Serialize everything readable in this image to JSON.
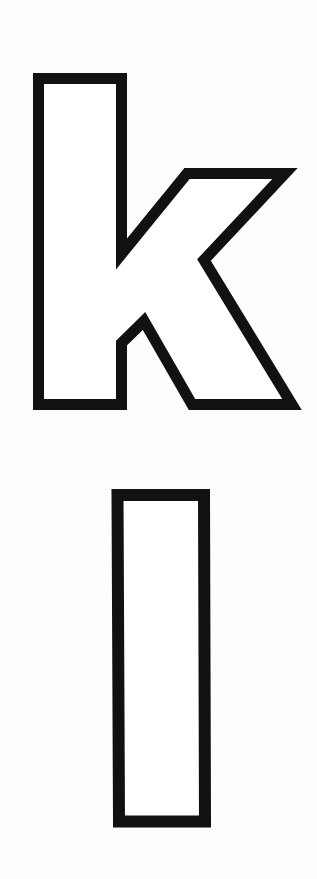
{
  "page": {
    "background": "#fdfdfd",
    "stroke_color": "#111111",
    "fill_color": "#ffffff"
  },
  "glyphs": [
    {
      "character": "k",
      "style": "outlined",
      "case": "lowercase"
    },
    {
      "character": "l",
      "style": "outlined",
      "case": "lowercase"
    }
  ]
}
